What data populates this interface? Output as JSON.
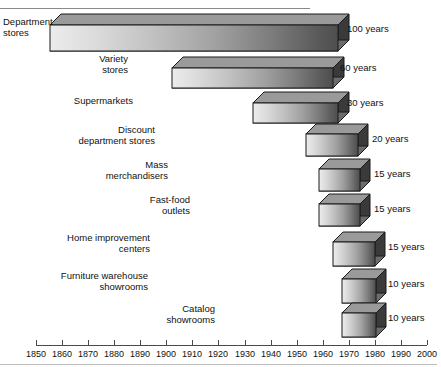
{
  "figure": {
    "top_rule": true,
    "bottom_rule": true
  },
  "chart_data": {
    "type": "bar",
    "orientation": "horizontal",
    "title": "",
    "xlabel": "",
    "ylabel": "",
    "xlim": [
      1850,
      2000
    ],
    "xticks": [
      1850,
      1860,
      1870,
      1880,
      1890,
      1900,
      1910,
      1920,
      1930,
      1940,
      1950,
      1960,
      1970,
      1980,
      1990,
      2000
    ],
    "xtick_labels": [
      "1850",
      "1860",
      "1870",
      "1880",
      "1890",
      "1900",
      "1910",
      "1920",
      "1930",
      "1940",
      "1950",
      "1960",
      "1970",
      "1980",
      "1990",
      "2000"
    ],
    "grid": false,
    "legend": "none",
    "categories": [
      "Department stores",
      "Variety stores",
      "Supermarkets",
      "Discount department stores",
      "Mass merchandisers",
      "Fast-food outlets",
      "Home improvement centers",
      "Furniture warehouse showrooms",
      "Catalog showrooms"
    ],
    "values": [
      100,
      60,
      30,
      20,
      15,
      15,
      15,
      10,
      10
    ],
    "value_labels": [
      "100 years",
      "60 years",
      "30 years",
      "20 years",
      "15 years",
      "15 years",
      "15 years",
      "10 years",
      "10 years"
    ],
    "value_unit": "years",
    "bar_start_years": [
      1855,
      1915,
      1945,
      1962,
      1968,
      1968,
      1968,
      1972,
      1972
    ],
    "bar_end_years": [
      1977,
      1973,
      1977,
      1981,
      1981,
      1981,
      1981,
      1981,
      1981
    ]
  },
  "bars": [
    {
      "name": "department-stores",
      "label_lines": [
        "Department",
        "stores"
      ],
      "value_label": "100 years",
      "label_align": "left",
      "label_x": 3,
      "label_y": 16,
      "bar_x": 50,
      "bar_y": 14,
      "bar_w": 288,
      "bar_h": 26,
      "depth": 11,
      "value_x": 347,
      "value_y": 23
    },
    {
      "name": "variety-stores",
      "label_lines": [
        "Variety",
        "stores"
      ],
      "value_label": "60 years",
      "label_align": "right",
      "label_x": 128,
      "label_y": 53,
      "bar_x": 172,
      "bar_y": 57,
      "bar_w": 161,
      "bar_h": 20,
      "depth": 11,
      "value_x": 340,
      "value_y": 62
    },
    {
      "name": "supermarkets",
      "label_lines": [
        "Supermarkets"
      ],
      "value_label": "30 years",
      "label_align": "right",
      "label_x": 133,
      "label_y": 95,
      "bar_x": 253,
      "bar_y": 92,
      "bar_w": 85,
      "bar_h": 20,
      "depth": 11,
      "value_x": 347,
      "value_y": 97
    },
    {
      "name": "discount-department-stores",
      "label_lines": [
        "Discount",
        "department stores"
      ],
      "value_label": "20 years",
      "label_align": "right",
      "label_x": 155,
      "label_y": 124,
      "bar_x": 306,
      "bar_y": 124,
      "bar_w": 52,
      "bar_h": 22,
      "depth": 10,
      "value_x": 372,
      "value_y": 133
    },
    {
      "name": "mass-merchandisers",
      "label_lines": [
        "Mass",
        "merchandisers"
      ],
      "value_label": "15 years",
      "label_align": "right",
      "label_x": 168,
      "label_y": 159,
      "bar_x": 319,
      "bar_y": 159,
      "bar_w": 41,
      "bar_h": 22,
      "depth": 10,
      "value_x": 374,
      "value_y": 168
    },
    {
      "name": "fast-food-outlets",
      "label_lines": [
        "Fast-food",
        "outlets"
      ],
      "value_label": "15 years",
      "label_align": "right",
      "label_x": 190,
      "label_y": 194,
      "bar_x": 319,
      "bar_y": 194,
      "bar_w": 41,
      "bar_h": 22,
      "depth": 10,
      "value_x": 374,
      "value_y": 203
    },
    {
      "name": "home-improvement-centers",
      "label_lines": [
        "Home improvement",
        "centers"
      ],
      "value_label": "15 years",
      "label_align": "right",
      "label_x": 150,
      "label_y": 232,
      "bar_x": 333,
      "bar_y": 232,
      "bar_w": 42,
      "bar_h": 24,
      "depth": 10,
      "value_x": 388,
      "value_y": 241
    },
    {
      "name": "furniture-warehouse-showrooms",
      "label_lines": [
        "Furniture warehouse",
        "showrooms"
      ],
      "value_label": "10 years",
      "label_align": "right",
      "label_x": 148,
      "label_y": 270,
      "bar_x": 342,
      "bar_y": 269,
      "bar_w": 34,
      "bar_h": 24,
      "depth": 10,
      "value_x": 388,
      "value_y": 278
    },
    {
      "name": "catalog-showrooms",
      "label_lines": [
        "Catalog",
        "showrooms"
      ],
      "value_label": "10 years",
      "label_align": "right",
      "label_x": 215,
      "label_y": 303,
      "bar_x": 342,
      "bar_y": 303,
      "bar_w": 34,
      "bar_h": 24,
      "depth": 10,
      "value_x": 388,
      "value_y": 312
    }
  ],
  "axis": {
    "x0": 36,
    "x1": 427,
    "y": 345,
    "tick_height": 5,
    "labels": [
      "1850",
      "1860",
      "1870",
      "1880",
      "1890",
      "1900",
      "1910",
      "1920",
      "1930",
      "1940",
      "1950",
      "1960",
      "1970",
      "1980",
      "1990",
      "2000"
    ]
  }
}
